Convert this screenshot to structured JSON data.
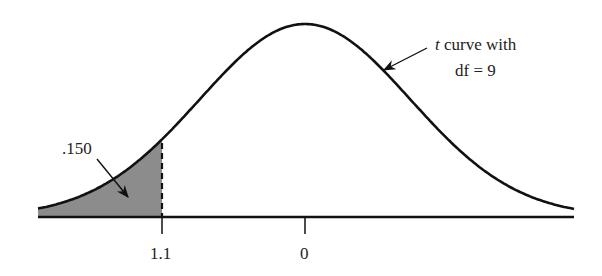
{
  "diagram": {
    "type": "t-distribution-area",
    "curve_label_italic": "t",
    "curve_label_rest": " curve with",
    "curve_label_line2": "df = 9",
    "area_label": ".150",
    "tick_labels": [
      "1.1",
      "0"
    ],
    "shaded_region": "left tail up to t = -1.1",
    "colors": {
      "curve": "#111111",
      "shade": "#8c8c8c",
      "text": "#222222"
    }
  }
}
